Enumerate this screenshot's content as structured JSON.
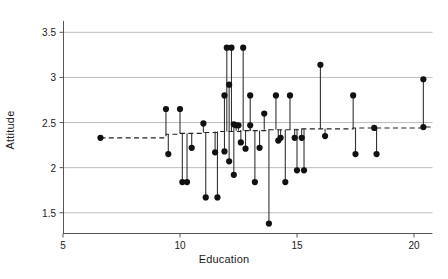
{
  "chart_data": {
    "type": "scatter",
    "title": "",
    "xlabel": "Education",
    "ylabel": "Attitude",
    "xlim": [
      4.2,
      21.3
    ],
    "ylim": [
      1.27,
      3.62
    ],
    "xticks": [
      5,
      10,
      15,
      20
    ],
    "xticklabels": [
      "5",
      "10",
      "15",
      "20"
    ],
    "yticks": [
      1.5,
      2,
      2.5,
      3,
      3.5
    ],
    "yticklabels": [
      "1.5",
      "2",
      "2.5",
      "3",
      "3.5"
    ],
    "grid": "horizontal",
    "legend": "none",
    "fitted_line_style": "dashed",
    "fitted_line": [
      {
        "x": 6.6,
        "y": 2.33
      },
      {
        "x": 9.4,
        "y": 2.37
      },
      {
        "x": 10.0,
        "y": 2.38
      },
      {
        "x": 10.4,
        "y": 2.38
      },
      {
        "x": 11.0,
        "y": 2.39
      },
      {
        "x": 11.6,
        "y": 2.4
      },
      {
        "x": 12.0,
        "y": 2.4
      },
      {
        "x": 12.3,
        "y": 2.4
      },
      {
        "x": 12.6,
        "y": 2.41
      },
      {
        "x": 13.0,
        "y": 2.41
      },
      {
        "x": 13.4,
        "y": 2.41
      },
      {
        "x": 13.8,
        "y": 2.42
      },
      {
        "x": 14.2,
        "y": 2.42
      },
      {
        "x": 14.7,
        "y": 2.42
      },
      {
        "x": 15.1,
        "y": 2.43
      },
      {
        "x": 15.6,
        "y": 2.43
      },
      {
        "x": 16.1,
        "y": 2.43
      },
      {
        "x": 17.4,
        "y": 2.44
      },
      {
        "x": 18.3,
        "y": 2.44
      },
      {
        "x": 20.4,
        "y": 2.45
      }
    ],
    "points": [
      {
        "x": 6.6,
        "y": 2.33,
        "fit": 2.33
      },
      {
        "x": 9.4,
        "y": 2.65,
        "fit": 2.37
      },
      {
        "x": 9.5,
        "y": 2.15,
        "fit": 2.37
      },
      {
        "x": 10.0,
        "y": 2.65,
        "fit": 2.38
      },
      {
        "x": 10.1,
        "y": 1.84,
        "fit": 2.38
      },
      {
        "x": 10.3,
        "y": 1.84,
        "fit": 2.38
      },
      {
        "x": 10.5,
        "y": 2.22,
        "fit": 2.38
      },
      {
        "x": 11.0,
        "y": 2.49,
        "fit": 2.39
      },
      {
        "x": 11.1,
        "y": 1.67,
        "fit": 2.39
      },
      {
        "x": 11.5,
        "y": 2.17,
        "fit": 2.4
      },
      {
        "x": 11.6,
        "y": 1.67,
        "fit": 2.4
      },
      {
        "x": 11.9,
        "y": 2.8,
        "fit": 2.4
      },
      {
        "x": 11.9,
        "y": 2.18,
        "fit": 2.4
      },
      {
        "x": 12.0,
        "y": 3.33,
        "fit": 2.4
      },
      {
        "x": 12.1,
        "y": 2.92,
        "fit": 2.4
      },
      {
        "x": 12.1,
        "y": 2.07,
        "fit": 2.4
      },
      {
        "x": 12.2,
        "y": 3.33,
        "fit": 2.4
      },
      {
        "x": 12.3,
        "y": 2.48,
        "fit": 2.4
      },
      {
        "x": 12.3,
        "y": 1.92,
        "fit": 2.4
      },
      {
        "x": 12.4,
        "y": 2.47,
        "fit": 2.41
      },
      {
        "x": 12.5,
        "y": 2.47,
        "fit": 2.41
      },
      {
        "x": 12.6,
        "y": 2.28,
        "fit": 2.41
      },
      {
        "x": 12.7,
        "y": 3.33,
        "fit": 2.41
      },
      {
        "x": 12.8,
        "y": 2.21,
        "fit": 2.41
      },
      {
        "x": 13.0,
        "y": 2.8,
        "fit": 2.41
      },
      {
        "x": 13.0,
        "y": 2.47,
        "fit": 2.41
      },
      {
        "x": 13.2,
        "y": 1.84,
        "fit": 2.41
      },
      {
        "x": 13.4,
        "y": 2.22,
        "fit": 2.41
      },
      {
        "x": 13.6,
        "y": 2.6,
        "fit": 2.42
      },
      {
        "x": 13.8,
        "y": 1.38,
        "fit": 2.42
      },
      {
        "x": 14.1,
        "y": 2.8,
        "fit": 2.42
      },
      {
        "x": 14.2,
        "y": 2.3,
        "fit": 2.42
      },
      {
        "x": 14.3,
        "y": 2.33,
        "fit": 2.42
      },
      {
        "x": 14.5,
        "y": 1.84,
        "fit": 2.42
      },
      {
        "x": 14.7,
        "y": 2.8,
        "fit": 2.42
      },
      {
        "x": 14.9,
        "y": 2.33,
        "fit": 2.43
      },
      {
        "x": 15.0,
        "y": 1.97,
        "fit": 2.43
      },
      {
        "x": 15.2,
        "y": 2.33,
        "fit": 2.43
      },
      {
        "x": 15.3,
        "y": 1.97,
        "fit": 2.43
      },
      {
        "x": 16.0,
        "y": 3.14,
        "fit": 2.43
      },
      {
        "x": 16.2,
        "y": 2.35,
        "fit": 2.43
      },
      {
        "x": 17.4,
        "y": 2.8,
        "fit": 2.44
      },
      {
        "x": 17.5,
        "y": 2.15,
        "fit": 2.44
      },
      {
        "x": 18.3,
        "y": 2.44,
        "fit": 2.44
      },
      {
        "x": 18.4,
        "y": 2.15,
        "fit": 2.44
      },
      {
        "x": 20.4,
        "y": 2.98,
        "fit": 2.45
      },
      {
        "x": 20.4,
        "y": 2.45,
        "fit": 2.45
      }
    ],
    "colors": {
      "point": "#111111",
      "stem": "#333333",
      "fit_line": "#222222",
      "grid": "#b5b5b5",
      "frame": "#555555",
      "text": "#1a1a1a",
      "background": "#ffffff"
    }
  }
}
